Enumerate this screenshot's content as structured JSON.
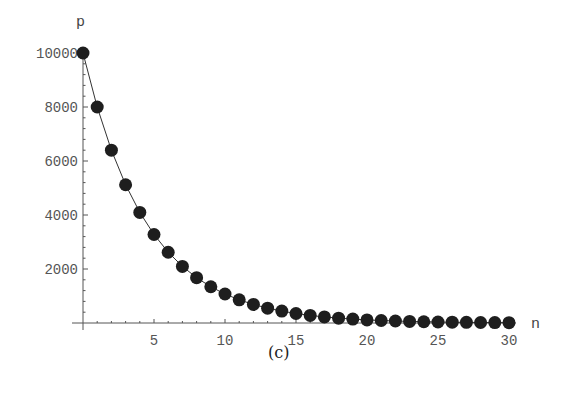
{
  "chart_data": {
    "type": "line",
    "title": "",
    "caption": "(c)",
    "xlabel": "n",
    "ylabel": "p",
    "xlim": [
      0,
      30
    ],
    "ylim": [
      0,
      10000
    ],
    "x_ticks": [
      5,
      10,
      15,
      20,
      25,
      30
    ],
    "y_ticks": [
      2000,
      4000,
      6000,
      8000,
      10000
    ],
    "grid": false,
    "legend": null,
    "markers": true,
    "series": [
      {
        "name": "p",
        "x": [
          0,
          1,
          2,
          3,
          4,
          5,
          6,
          7,
          8,
          9,
          10,
          11,
          12,
          13,
          14,
          15,
          16,
          17,
          18,
          19,
          20,
          21,
          22,
          23,
          24,
          25,
          26,
          27,
          28,
          29,
          30
        ],
        "values": [
          10000,
          8000,
          6400,
          5120,
          4096,
          3277,
          2621,
          2097,
          1678,
          1342,
          1074,
          859,
          687,
          550,
          440,
          352,
          281,
          225,
          180,
          144,
          115,
          92,
          74,
          59,
          47,
          38,
          30,
          24,
          19,
          15,
          12
        ]
      }
    ]
  }
}
